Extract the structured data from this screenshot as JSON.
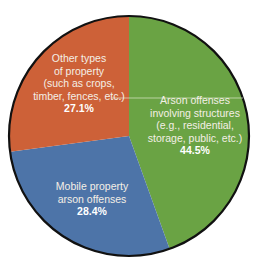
{
  "chart_data": {
    "type": "pie",
    "title": "",
    "start_angle_deg": 0,
    "direction": "clockwise",
    "slices": [
      {
        "label": "Arson offenses involving structures (e.g., residential, storage, public, etc.)",
        "label_lines": [
          "Arson offenses",
          "involving structures",
          "(e.g., residential,",
          "storage, public, etc.)"
        ],
        "value": 44.5,
        "value_label": "44.5%",
        "color": "#6aa344"
      },
      {
        "label": "Mobile property arson offenses",
        "label_lines": [
          "Mobile property",
          "arson offenses"
        ],
        "value": 28.4,
        "value_label": "28.4%",
        "color": "#4d74a8"
      },
      {
        "label": "Other types of property (such as crops, timber, fences, etc.)",
        "label_lines": [
          "Other types",
          "of property",
          "(such as crops,",
          "timber, fences, etc.)"
        ],
        "value": 27.1,
        "value_label": "27.1%",
        "color": "#cd6138"
      }
    ],
    "legend": "none",
    "labels_inside": true,
    "outline_color": "#111111"
  }
}
